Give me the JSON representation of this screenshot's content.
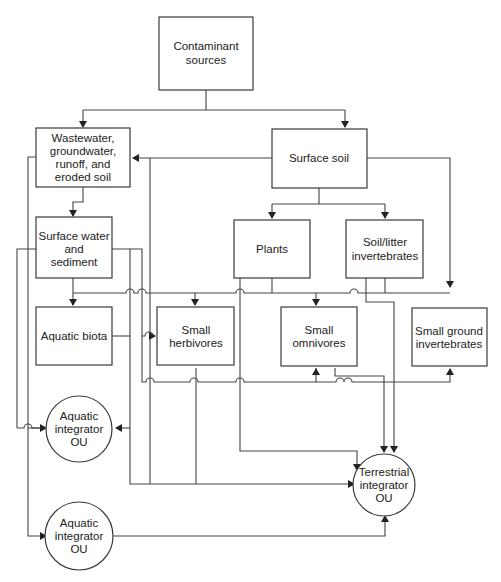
{
  "diagram": {
    "type": "flow",
    "nodes": {
      "contaminant_sources": {
        "line1": "Contaminant",
        "line2": "sources"
      },
      "wastewater": {
        "line1": "Wastewater,",
        "line2": "groundwater,",
        "line3": "runoff, and",
        "line4": "eroded soil"
      },
      "surface_soil": {
        "line1": "Surface soil"
      },
      "surface_water": {
        "line1": "Surface water",
        "line2": "and",
        "line3": "sediment"
      },
      "plants": {
        "line1": "Plants"
      },
      "soil_litter_invertebrates": {
        "line1": "Soil/litter",
        "line2": "invertebrates"
      },
      "aquatic_biota": {
        "line1": "Aquatic biota"
      },
      "small_herbivores": {
        "line1": "Small",
        "line2": "herbivores"
      },
      "small_omnivores": {
        "line1": "Small",
        "line2": "omnivores"
      },
      "small_ground_invertebrates": {
        "line1": "Small ground",
        "line2": "invertebrates"
      },
      "aquatic_integrator_1": {
        "line1": "Aquatic",
        "line2": "integrator",
        "line3": "OU"
      },
      "aquatic_integrator_2": {
        "line1": "Aquatic",
        "line2": "integrator",
        "line3": "OU"
      },
      "terrestrial_integrator": {
        "line1": "Terrestrial",
        "line2": "integrator",
        "line3": "OU"
      }
    },
    "edges": [
      {
        "from": "Contaminant sources",
        "to": "Wastewater, groundwater, runoff, and eroded soil"
      },
      {
        "from": "Contaminant sources",
        "to": "Surface soil"
      },
      {
        "from": "Surface soil",
        "to": "Wastewater, groundwater, runoff, and eroded soil"
      },
      {
        "from": "Surface soil",
        "to": "Plants"
      },
      {
        "from": "Surface soil",
        "to": "Soil/litter invertebrates"
      },
      {
        "from": "Surface soil",
        "to": "Small ground invertebrates"
      },
      {
        "from": "Wastewater, groundwater, runoff, and eroded soil",
        "to": "Surface water and sediment"
      },
      {
        "from": "Wastewater, groundwater, runoff, and eroded soil",
        "to": "Aquatic integrator OU"
      },
      {
        "from": "Wastewater, groundwater, runoff, and eroded soil",
        "to": "Aquatic integrator OU (lower)"
      },
      {
        "from": "Surface water and sediment",
        "to": "Aquatic biota"
      },
      {
        "from": "Surface water and sediment",
        "to": "Small herbivores"
      },
      {
        "from": "Surface water and sediment",
        "to": "Small omnivores"
      },
      {
        "from": "Surface water and sediment",
        "to": "Small ground invertebrates"
      },
      {
        "from": "Surface water and sediment",
        "to": "Aquatic integrator OU"
      },
      {
        "from": "Plants",
        "to": "Small herbivores"
      },
      {
        "from": "Plants",
        "to": "Small omnivores"
      },
      {
        "from": "Plants",
        "to": "Terrestrial integrator OU"
      },
      {
        "from": "Soil/litter invertebrates",
        "to": "Small omnivores"
      },
      {
        "from": "Soil/litter invertebrates",
        "to": "Small ground invertebrates"
      },
      {
        "from": "Soil/litter invertebrates",
        "to": "Terrestrial integrator OU"
      },
      {
        "from": "Aquatic biota",
        "to": "Terrestrial integrator OU"
      },
      {
        "from": "Small herbivores",
        "to": "Terrestrial integrator OU"
      },
      {
        "from": "Small omnivores",
        "to": "Terrestrial integrator OU"
      },
      {
        "from": "Aquatic integrator OU (lower)",
        "to": "Terrestrial integrator OU"
      }
    ]
  }
}
